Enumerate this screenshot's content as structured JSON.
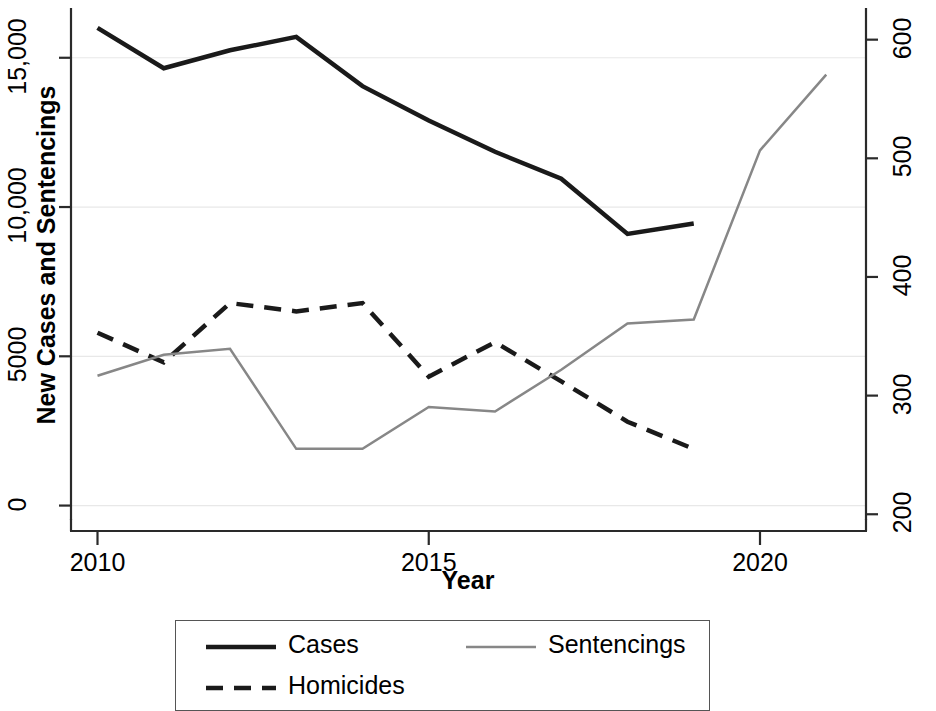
{
  "chart_data": {
    "type": "line",
    "title": "",
    "xlabel": "Year",
    "ylabel": "New Cases and Sentencings",
    "ylabel_right": "Homicides",
    "xlim": [
      2009.6,
      2021.6
    ],
    "ylim": [
      -450,
      16600
    ],
    "ylim_right": [
      196,
      625
    ],
    "xticks": [
      2010,
      2015,
      2020
    ],
    "xtick_labels": [
      "2010",
      "2015",
      "2020"
    ],
    "yticks_left": [
      0,
      5000,
      10000,
      15000
    ],
    "ytick_labels_left": [
      "0",
      "5000",
      "10,000",
      "15,000"
    ],
    "yticks_right": [
      200,
      300,
      400,
      500,
      600
    ],
    "ytick_labels_right": [
      "200",
      "300",
      "400",
      "500",
      "600"
    ],
    "grid": true,
    "grid_color": "#e8e8e8",
    "legend_position": "bottom",
    "series": [
      {
        "name": "Cases",
        "axis": "left",
        "color": "#1a1a1a",
        "style": "solid",
        "width": 4.5,
        "x": [
          2010,
          2011,
          2012,
          2013,
          2014,
          2015,
          2016,
          2017,
          2018,
          2019
        ],
        "values": [
          16000,
          14650,
          15250,
          15700,
          14050,
          12900,
          11850,
          10950,
          9100,
          9450
        ]
      },
      {
        "name": "Homicides",
        "axis": "right",
        "color": "#1a1a1a",
        "style": "dashed",
        "width": 4.5,
        "x": [
          2010,
          2011,
          2012,
          2013,
          2014,
          2015,
          2016,
          2017,
          2018,
          2019
        ],
        "values": [
          353,
          328,
          378,
          371,
          378,
          316,
          345,
          312,
          278,
          255
        ]
      },
      {
        "name": "Sentencings",
        "axis": "left",
        "color": "#878787",
        "style": "solid",
        "width": 2.5,
        "x": [
          2010,
          2011,
          2012,
          2013,
          2014,
          2015,
          2016,
          2017,
          2018,
          2019,
          2020,
          2021
        ],
        "values": [
          4350,
          5050,
          5250,
          1900,
          1900,
          3300,
          3150,
          4550,
          6100,
          6233,
          11900,
          14433
        ]
      }
    ]
  },
  "legend": {
    "entries": [
      {
        "label": "Cases",
        "style": "solid",
        "color": "#1a1a1a"
      },
      {
        "label": "Sentencings",
        "style": "solid",
        "color": "#878787"
      },
      {
        "label": "Homicides",
        "style": "dashed",
        "color": "#1a1a1a"
      }
    ]
  }
}
